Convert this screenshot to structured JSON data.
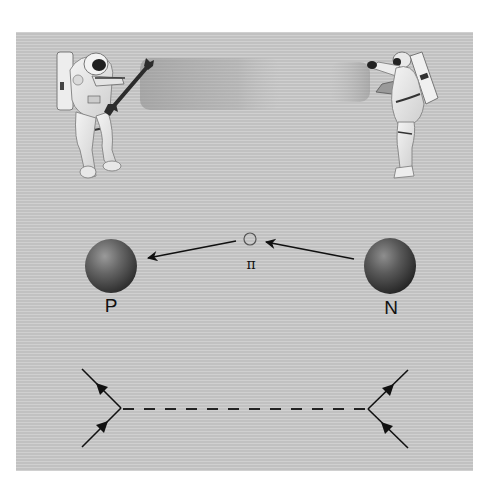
{
  "figure": {
    "background_color": "#cbcbcb",
    "top_scene": {
      "description": "Two astronauts exchanging a wrench (analogy for force via particle exchange)",
      "left_astronaut": {
        "holding": "wrench"
      },
      "right_astronaut": {
        "pose": "arms raised to catch"
      }
    },
    "middle_scene": {
      "proton": {
        "label": "P",
        "color": "#555555"
      },
      "neutron": {
        "label": "N",
        "color": "#4a4a4a"
      },
      "pion": {
        "label": "π"
      },
      "arrows": [
        {
          "from": "neutron",
          "to": "pion"
        },
        {
          "from": "pion",
          "to": "proton"
        }
      ]
    },
    "bottom_scene": {
      "type": "feynman-diagram",
      "left_vertex": {
        "incoming": "lower-left",
        "outgoing": "upper-left"
      },
      "right_vertex": {
        "incoming": "lower-right",
        "outgoing": "upper-right"
      },
      "propagator": "dashed"
    }
  }
}
